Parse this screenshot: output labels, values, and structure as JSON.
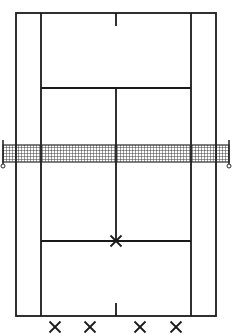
{
  "diagram": {
    "type": "tennis-court",
    "view": "top-down",
    "colors": {
      "line": "#1a1a1a",
      "background": "#ffffff",
      "net": "#2a2a2a"
    },
    "court": {
      "doubles_left_x": 16,
      "doubles_right_x": 216,
      "singles_left_x": 41,
      "singles_right_x": 191,
      "center_x": 116,
      "top_baseline_y": 13,
      "bottom_baseline_y": 316,
      "top_service_line_y": 88,
      "bottom_service_line_y": 241,
      "net_y_top": 145,
      "net_y_bottom": 162,
      "center_mark_length": 13
    },
    "net": {
      "left_post_x": 3,
      "right_post_x": 229
    },
    "markers": [
      {
        "symbol": "×",
        "label": "player-position-center-service-T",
        "x": 116,
        "y": 241
      },
      {
        "symbol": "×",
        "label": "player-position-1",
        "x": 55,
        "y": 327
      },
      {
        "symbol": "×",
        "label": "player-position-2",
        "x": 90,
        "y": 327
      },
      {
        "symbol": "×",
        "label": "player-position-3",
        "x": 140,
        "y": 327
      },
      {
        "symbol": "×",
        "label": "player-position-4",
        "x": 176,
        "y": 327
      }
    ]
  }
}
